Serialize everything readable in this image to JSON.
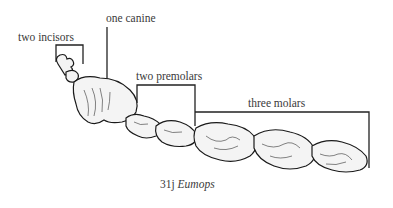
{
  "figure": {
    "labels": {
      "incisors": "two incisors",
      "canine": "one canine",
      "premolars": "two premolars",
      "molars": "three molars"
    },
    "caption": {
      "number": "31j",
      "genus": "Eumops"
    }
  }
}
